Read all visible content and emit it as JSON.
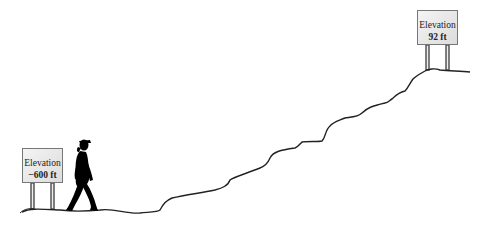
{
  "diagram": {
    "signs": [
      {
        "label": "Elevation",
        "value": "−600 ft"
      },
      {
        "label": "Elevation",
        "value": "92 ft"
      }
    ],
    "figure": "walking-person-silhouette",
    "path": "rising-trail",
    "colors": {
      "line": "#222222",
      "sign_border": "#777777",
      "figure": "#000000"
    }
  }
}
